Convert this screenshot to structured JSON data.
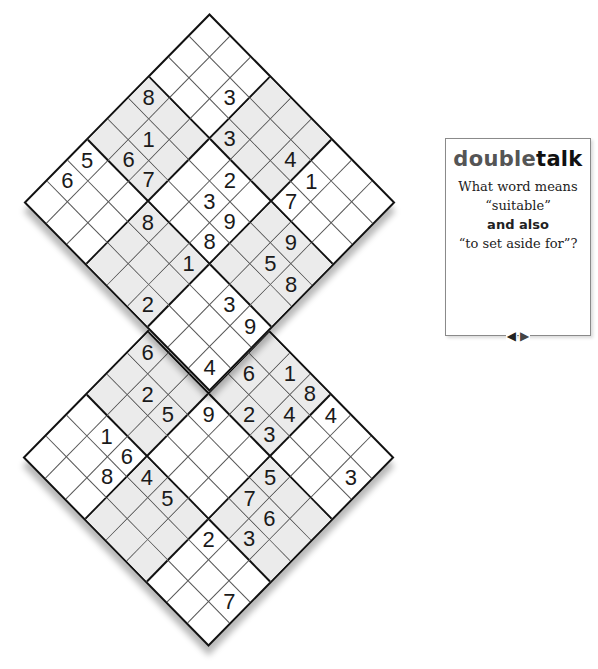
{
  "puzzles": {
    "top": {
      "name": "top-sudoku",
      "shaded_boxes": [
        [
          0,
          1
        ],
        [
          1,
          0
        ],
        [
          1,
          2
        ],
        [
          2,
          1
        ]
      ],
      "givens": [
        {
          "r": 1,
          "c": 2,
          "v": "3"
        },
        {
          "r": 2,
          "c": 3,
          "v": "3"
        },
        {
          "r": 3,
          "c": 0,
          "v": "8"
        },
        {
          "r": 4,
          "c": 1,
          "v": "1"
        },
        {
          "r": 6,
          "c": 0,
          "v": "5"
        },
        {
          "r": 5,
          "c": 1,
          "v": "6"
        },
        {
          "r": 1,
          "c": 5,
          "v": "4"
        },
        {
          "r": 7,
          "c": 0,
          "v": "6"
        },
        {
          "r": 5,
          "c": 2,
          "v": "7"
        },
        {
          "r": 3,
          "c": 4,
          "v": "2"
        },
        {
          "r": 1,
          "c": 6,
          "v": "1"
        },
        {
          "r": 4,
          "c": 4,
          "v": "3"
        },
        {
          "r": 2,
          "c": 6,
          "v": "7"
        },
        {
          "r": 6,
          "c": 3,
          "v": "8"
        },
        {
          "r": 4,
          "c": 5,
          "v": "9"
        },
        {
          "r": 5,
          "c": 5,
          "v": "8"
        },
        {
          "r": 3,
          "c": 7,
          "v": "9"
        },
        {
          "r": 6,
          "c": 5,
          "v": "1"
        },
        {
          "r": 4,
          "c": 7,
          "v": "5"
        },
        {
          "r": 4,
          "c": 8,
          "v": "8"
        },
        {
          "r": 8,
          "c": 5,
          "v": "2"
        },
        {
          "r": 6,
          "c": 7,
          "v": "3"
        },
        {
          "r": 6,
          "c": 8,
          "v": "9"
        },
        {
          "r": 8,
          "c": 8,
          "v": "4"
        }
      ]
    },
    "bottom": {
      "name": "bottom-sudoku",
      "shaded_boxes": [
        [
          0,
          1
        ],
        [
          1,
          0
        ],
        [
          1,
          2
        ],
        [
          2,
          1
        ]
      ],
      "givens": [
        {
          "r": 3,
          "c": 0,
          "v": "6"
        },
        {
          "r": 1,
          "c": 3,
          "v": "6"
        },
        {
          "r": 0,
          "c": 4,
          "v": "1"
        },
        {
          "r": 4,
          "c": 1,
          "v": "2"
        },
        {
          "r": 0,
          "c": 5,
          "v": "8"
        },
        {
          "r": 4,
          "c": 2,
          "v": "5"
        },
        {
          "r": 3,
          "c": 3,
          "v": "9"
        },
        {
          "r": 2,
          "c": 4,
          "v": "2"
        },
        {
          "r": 1,
          "c": 5,
          "v": "4"
        },
        {
          "r": 0,
          "c": 6,
          "v": "4"
        },
        {
          "r": 6,
          "c": 1,
          "v": "1"
        },
        {
          "r": 2,
          "c": 5,
          "v": "3"
        },
        {
          "r": 6,
          "c": 2,
          "v": "6"
        },
        {
          "r": 7,
          "c": 2,
          "v": "8"
        },
        {
          "r": 6,
          "c": 3,
          "v": "4"
        },
        {
          "r": 3,
          "c": 6,
          "v": "5"
        },
        {
          "r": 1,
          "c": 8,
          "v": "3"
        },
        {
          "r": 6,
          "c": 4,
          "v": "5"
        },
        {
          "r": 4,
          "c": 6,
          "v": "7"
        },
        {
          "r": 4,
          "c": 7,
          "v": "6"
        },
        {
          "r": 6,
          "c": 6,
          "v": "2"
        },
        {
          "r": 5,
          "c": 7,
          "v": "3"
        },
        {
          "r": 7,
          "c": 8,
          "v": "7"
        }
      ]
    }
  },
  "panel": {
    "title_part1": "double",
    "title_part2": "talk",
    "line1": "What word means",
    "line2": "“suitable”",
    "line3": "and also",
    "line4": "“to set aside for”?",
    "prev_icon": "◀",
    "next_icon": "▶"
  },
  "colors": {
    "shade": "#ebebeb",
    "grid_line": "#111111",
    "title_light": "#555555"
  }
}
